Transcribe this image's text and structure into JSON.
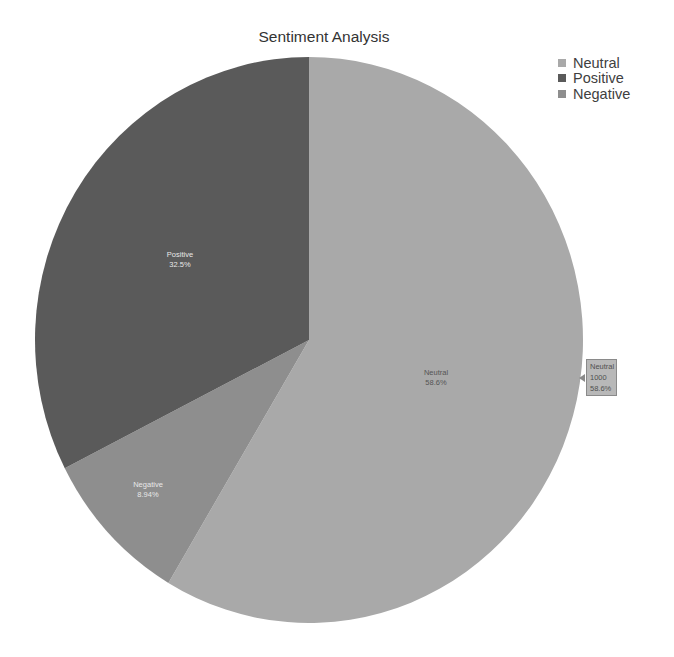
{
  "chart_data": {
    "type": "pie",
    "title": "Sentiment Analysis",
    "categories": [
      "Neutral",
      "Positive",
      "Negative"
    ],
    "values": [
      1000,
      555,
      153
    ],
    "percentages": [
      58.6,
      32.5,
      8.94
    ],
    "colors": {
      "Neutral": "#a9a9a9",
      "Positive": "#5a5a5a",
      "Negative": "#8e8e8e"
    },
    "slice_labels": [
      {
        "name": "Neutral",
        "pct": "58.6%"
      },
      {
        "name": "Positive",
        "pct": "32.5%"
      },
      {
        "name": "Negative",
        "pct": "8.94%"
      }
    ],
    "legend": {
      "position": "top-right",
      "entries": [
        "Neutral",
        "Positive",
        "Negative"
      ]
    },
    "tooltip": {
      "category": "Neutral",
      "value": "1000",
      "pct": "58.6%"
    }
  }
}
